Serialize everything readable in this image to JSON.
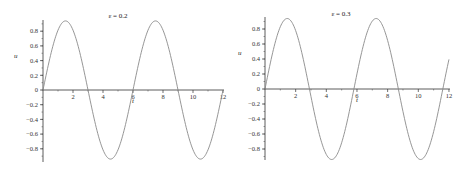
{
  "chart_data": [
    {
      "type": "line",
      "title": "ε = 0.2",
      "xlabel": "t",
      "ylabel": "u",
      "xlim": [
        0,
        12
      ],
      "ylim": [
        -0.95,
        0.95
      ],
      "xticks": [
        2,
        4,
        6,
        8,
        10,
        12
      ],
      "yticks": [
        -0.8,
        -0.6,
        -0.4,
        -0.2,
        0,
        0.2,
        0.4,
        0.6,
        0.8
      ],
      "grid": false,
      "series": [
        {
          "name": "u(t)",
          "color": "#8a8a8a",
          "amplitude": 0.94,
          "period": 6.0,
          "x": [
            0,
            0.5,
            1.0,
            1.5,
            2.0,
            2.5,
            3.0,
            3.5,
            4.0,
            4.5,
            5.0,
            5.5,
            6.0,
            6.5,
            7.0,
            7.5,
            8.0,
            8.5,
            9.0,
            9.5,
            10.0,
            10.5,
            11.0,
            11.5,
            12.0
          ],
          "y": [
            0,
            0.47,
            0.81,
            0.94,
            0.81,
            0.47,
            0,
            -0.47,
            -0.81,
            -0.94,
            -0.81,
            -0.47,
            0,
            0.47,
            0.81,
            0.94,
            0.81,
            0.47,
            0,
            -0.47,
            -0.81,
            -0.94,
            -0.81,
            -0.47,
            0.2
          ]
        }
      ]
    },
    {
      "type": "line",
      "title": "ε = 0.3",
      "xlabel": "t",
      "ylabel": "u",
      "xlim": [
        0,
        12
      ],
      "ylim": [
        -0.95,
        0.95
      ],
      "xticks": [
        2,
        4,
        6,
        8,
        10,
        12
      ],
      "yticks": [
        -0.8,
        -0.6,
        -0.4,
        -0.2,
        0,
        0.2,
        0.4,
        0.6,
        0.8
      ],
      "grid": false,
      "series": [
        {
          "name": "u(t)",
          "color": "#8a8a8a",
          "amplitude": 0.94,
          "period": 5.8,
          "x": [
            0,
            0.5,
            1.0,
            1.45,
            2.0,
            2.5,
            2.9,
            3.5,
            4.0,
            4.35,
            5.0,
            5.5,
            5.8,
            6.5,
            7.0,
            7.25,
            8.0,
            8.5,
            8.7,
            9.5,
            10.0,
            10.15,
            11.0,
            11.6,
            12.0
          ],
          "y": [
            0,
            0.48,
            0.85,
            0.94,
            0.79,
            0.41,
            0,
            -0.64,
            -0.92,
            -0.94,
            -0.75,
            -0.31,
            0,
            0.66,
            0.93,
            0.94,
            0.67,
            0.2,
            0,
            -0.75,
            -0.93,
            -0.94,
            -0.6,
            0,
            0.5
          ]
        }
      ]
    }
  ],
  "plots": [
    {
      "title": "ε = 0.2",
      "xlabel": "t",
      "ylabel": "u"
    },
    {
      "title": "ε = 0.3",
      "xlabel": "t",
      "ylabel": "u"
    }
  ]
}
